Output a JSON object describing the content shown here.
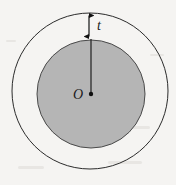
{
  "figure": {
    "name": "annulus-cross-section",
    "canvas": {
      "width": 176,
      "height": 185,
      "background": "#f5f4f2"
    },
    "outer_circle": {
      "name": "outer-circle",
      "cx": 90,
      "cy": 91,
      "r": 78,
      "fill": "none",
      "stroke": "#2b2b2b"
    },
    "inner_circle": {
      "name": "inner-shaded-disc",
      "cx": 91,
      "cy": 94,
      "r": 54,
      "fill": "#b5b5b5",
      "stroke": "#4a4a4a"
    },
    "center_point": {
      "name": "center-point",
      "cx": 91,
      "cy": 94,
      "r": 2.2,
      "color": "#111111"
    },
    "radius_line": {
      "name": "radius-line",
      "x1": 91,
      "y1": 39,
      "x2": 91,
      "y2": 94,
      "color": "#1f1f1f"
    },
    "thickness_dimension": {
      "name": "thickness-dimension-arrow",
      "x": 89,
      "y_top": 13,
      "y_bottom": 39,
      "color": "#111111"
    },
    "labels": {
      "thickness": "t",
      "center": "O"
    }
  }
}
